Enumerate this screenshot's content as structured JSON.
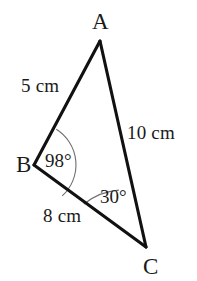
{
  "figure": {
    "name": "triangle-abc",
    "background_color": "#ffffff",
    "stroke_color": "#111111",
    "arc_color": "#666666",
    "vertices": [
      {
        "id": "A",
        "label": "A",
        "x": 100,
        "y": 41
      },
      {
        "id": "B",
        "label": "B",
        "x": 34,
        "y": 165
      },
      {
        "id": "C",
        "label": "C",
        "x": 146,
        "y": 247
      }
    ],
    "sides": [
      {
        "id": "AB",
        "label": "5 cm",
        "from": "A",
        "to": "B"
      },
      {
        "id": "AC",
        "label": "10 cm",
        "from": "A",
        "to": "C"
      },
      {
        "id": "BC",
        "label": "8 cm",
        "from": "B",
        "to": "C"
      }
    ],
    "angles": [
      {
        "id": "B",
        "label": "98°",
        "vertex": "B",
        "value": 98,
        "arc_radius": 42
      },
      {
        "id": "C",
        "label": "30°",
        "vertex": "C",
        "value": 30,
        "arc_radius": 63
      }
    ]
  }
}
